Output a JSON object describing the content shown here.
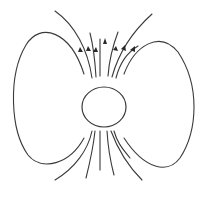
{
  "diagram": {
    "title": "",
    "colors": {
      "stroke": "#3a3a3a",
      "background": "#ffffff"
    },
    "sphere": {
      "cx": 104,
      "cy": 107,
      "r": 21
    },
    "arrow_count": 7,
    "field_lines_top": 7,
    "field_lines_bottom": 7,
    "closed_loops": 2
  }
}
